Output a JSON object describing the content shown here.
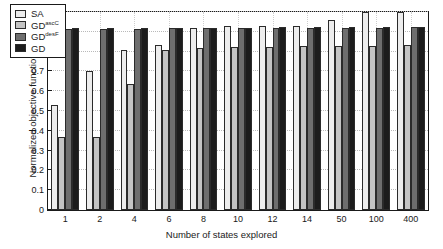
{
  "chart_data": {
    "type": "bar",
    "title": "",
    "xlabel": "Number of states explored",
    "ylabel": "Normalized objective function",
    "categories": [
      "1",
      "2",
      "4",
      "6",
      "8",
      "10",
      "12",
      "14",
      "50",
      "100",
      "400"
    ],
    "ylim": [
      0,
      1
    ],
    "yticks": [
      "0",
      "0.1",
      "0.2",
      "0.3",
      "0.4",
      "0.5",
      "0.6",
      "0.7",
      "0.8",
      "0.9",
      "1"
    ],
    "grid": true,
    "legend_position": "upper-left",
    "series": [
      {
        "name": "SA",
        "label_base": "SA",
        "label_sup": "",
        "color": "#ededed",
        "values": [
          0.53,
          0.7,
          0.81,
          0.835,
          0.92,
          0.93,
          0.93,
          0.93,
          0.96,
          1.0,
          1.0
        ]
      },
      {
        "name": "GDascC",
        "label_base": "GD",
        "label_sup": "ascC",
        "color": "#c4c4c4",
        "values": [
          0.37,
          0.37,
          0.635,
          0.81,
          0.82,
          0.822,
          0.823,
          0.826,
          0.828,
          0.828,
          0.831
        ]
      },
      {
        "name": "GDdesF",
        "label_base": "GD",
        "label_sup": "desF",
        "color": "#6e6e6e",
        "values": [
          0.915,
          0.915,
          0.915,
          0.918,
          0.918,
          0.918,
          0.92,
          0.92,
          0.92,
          0.92,
          0.922
        ]
      },
      {
        "name": "GD",
        "label_base": "GD",
        "label_sup": "",
        "color": "#1c1c1c",
        "values": [
          0.918,
          0.918,
          0.918,
          0.92,
          0.92,
          0.92,
          0.922,
          0.922,
          0.922,
          0.922,
          0.924
        ]
      }
    ]
  }
}
